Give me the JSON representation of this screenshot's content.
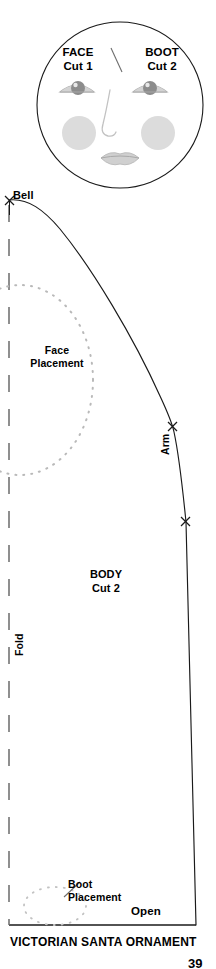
{
  "page": {
    "title": "VICTORIAN SANTA ORNAMENT",
    "page_number": "39",
    "background_color": "#ffffff",
    "line_color": "#1a1a1a"
  },
  "face_piece": {
    "label_left_name": "FACE",
    "label_left_cut": "Cut 1",
    "divider": "/",
    "label_right_name": "BOOT",
    "label_right_cut": "Cut 2",
    "shape": "circle",
    "features": [
      "left-eye",
      "right-eye",
      "nose",
      "left-cheek",
      "right-cheek",
      "mouth"
    ],
    "feature_color": "#b5b5b5",
    "iris_color": "#8a8a8a"
  },
  "body_piece": {
    "name": "BODY",
    "cut": "Cut 2",
    "markers": {
      "bell": "Bell",
      "arm": "Arm",
      "fold": "Fold",
      "open": "Open"
    },
    "placements": [
      {
        "label_line1": "Face",
        "label_line2": "Placement"
      },
      {
        "label_line1": "Boot",
        "label_line2": "Placement"
      }
    ],
    "notch_count": 3
  }
}
